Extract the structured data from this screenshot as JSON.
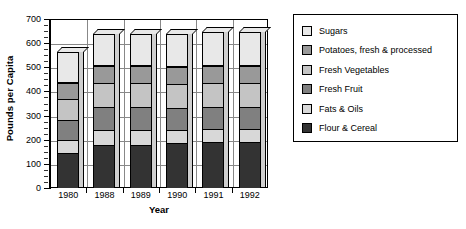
{
  "chart_data": {
    "type": "bar",
    "subtype": "stacked-column-3d",
    "title": "",
    "xlabel": "Year",
    "ylabel": "Pounds per Capita",
    "categories": [
      "1980",
      "1988",
      "1989",
      "1990",
      "1991",
      "1992"
    ],
    "ylim": [
      0,
      700
    ],
    "ytick_values": [
      0,
      100,
      200,
      300,
      400,
      500,
      600,
      700
    ],
    "ytick_labels": [
      "0",
      "100",
      "200",
      "300",
      "400",
      "500",
      "600",
      "700"
    ],
    "ytick_step": 100,
    "minor_ticks": true,
    "grid": "horizontal-and-vertical",
    "legend_position": "right-outside",
    "stack_order_bottom_to_top": [
      "Flour & Cereal",
      "Fats & Oils",
      "Fresh Fruit",
      "Fresh Vegetables",
      "Potatoes, fresh & processed",
      "Sugars"
    ],
    "series": [
      {
        "name": "Sugars",
        "color": "#e8e8e8",
        "values": [
          130,
          135,
          135,
          140,
          140,
          140
        ]
      },
      {
        "name": "Potatoes, fresh & processed",
        "color": "#999999",
        "values": [
          65,
          70,
          70,
          70,
          70,
          70
        ]
      },
      {
        "name": "Fresh Vegetables",
        "color": "#c4c4c4",
        "values": [
          90,
          100,
          100,
          100,
          100,
          100
        ]
      },
      {
        "name": "Fresh Fruit",
        "color": "#808080",
        "values": [
          80,
          95,
          95,
          90,
          90,
          90
        ]
      },
      {
        "name": "Fats & Oils",
        "color": "#d8d8d8",
        "values": [
          55,
          60,
          60,
          55,
          55,
          55
        ]
      },
      {
        "name": "Flour & Cereal",
        "color": "#333333",
        "values": [
          145,
          180,
          180,
          185,
          190,
          190
        ]
      }
    ],
    "totals": [
      565,
      640,
      640,
      640,
      645,
      645
    ]
  },
  "legend": {
    "items": [
      {
        "label": "Sugars",
        "color": "#e8e8e8"
      },
      {
        "label": "Potatoes, fresh & processed",
        "color": "#999999"
      },
      {
        "label": "Fresh Vegetables",
        "color": "#c4c4c4"
      },
      {
        "label": "Fresh Fruit",
        "color": "#808080"
      },
      {
        "label": "Fats & Oils",
        "color": "#d8d8d8"
      },
      {
        "label": "Flour & Cereal",
        "color": "#333333"
      }
    ]
  }
}
